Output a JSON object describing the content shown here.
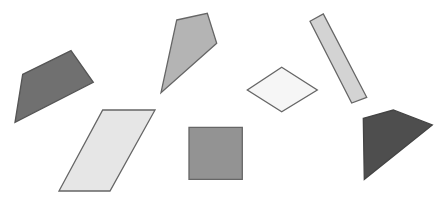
{
  "canvas": {
    "width": 448,
    "height": 204,
    "background": "#ffffff"
  },
  "shapes": [
    {
      "id": "dark-quad-left",
      "kind": "quadrilateral",
      "fill": "#707070",
      "stroke": "#555555",
      "points": [
        [
          22.7,
          74.3
        ],
        [
          71,
          50.7
        ],
        [
          93.3,
          82.3
        ],
        [
          15,
          122.3
        ]
      ]
    },
    {
      "id": "kite-top",
      "kind": "kite",
      "fill": "#b4b4b4",
      "stroke": "#666666",
      "points": [
        [
          176.7,
          20
        ],
        [
          207.3,
          13.3
        ],
        [
          216.7,
          43.3
        ],
        [
          161,
          92.7
        ]
      ]
    },
    {
      "id": "parallelogram",
      "kind": "parallelogram",
      "fill": "#e6e6e6",
      "stroke": "#666666",
      "points": [
        [
          102.7,
          110
        ],
        [
          155,
          110
        ],
        [
          110,
          191
        ],
        [
          59,
          191
        ]
      ]
    },
    {
      "id": "square",
      "kind": "square",
      "fill": "#939393",
      "stroke": "#666666",
      "points": [
        [
          189,
          127.3
        ],
        [
          242.3,
          127.3
        ],
        [
          242.3,
          179.3
        ],
        [
          189,
          179.3
        ]
      ]
    },
    {
      "id": "rhombus",
      "kind": "rhombus",
      "fill": "#f6f6f6",
      "stroke": "#666666",
      "points": [
        [
          281.7,
          67.3
        ],
        [
          317.3,
          90
        ],
        [
          281.7,
          111.7
        ],
        [
          247.3,
          90
        ]
      ]
    },
    {
      "id": "tilted-rectangle",
      "kind": "rectangle",
      "fill": "#d3d3d3",
      "stroke": "#666666",
      "points": [
        [
          310,
          21.3
        ],
        [
          323.3,
          14
        ],
        [
          366.7,
          97.3
        ],
        [
          351.7,
          103
        ]
      ]
    },
    {
      "id": "dark-quad-right",
      "kind": "quadrilateral",
      "fill": "#4e4e4e",
      "stroke": "#444444",
      "points": [
        [
          363.3,
          118.3
        ],
        [
          393.3,
          110
        ],
        [
          432.3,
          125
        ],
        [
          364.3,
          179.3
        ]
      ]
    }
  ]
}
